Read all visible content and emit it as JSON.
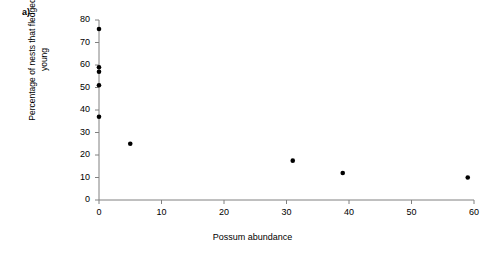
{
  "panel": {
    "label": "a)"
  },
  "chart_data": {
    "type": "scatter",
    "title": "",
    "subtitle": "",
    "xlabel": "Possum abundance",
    "ylabel": "Percentage of nests that fledged young",
    "xlim": [
      0,
      60
    ],
    "ylim": [
      0,
      80
    ],
    "xticks": [
      0,
      10,
      20,
      30,
      40,
      50,
      60
    ],
    "yticks": [
      0,
      10,
      20,
      30,
      40,
      50,
      60,
      70,
      80
    ],
    "xtick_labels": [
      "0",
      "10",
      "20",
      "30",
      "40",
      "50",
      "60"
    ],
    "ytick_labels": [
      "0",
      "10",
      "20",
      "30",
      "40",
      "50",
      "60",
      "70",
      "80"
    ],
    "grid": false,
    "legend": null,
    "marker": "filled-circle",
    "marker_color": "#000000",
    "marker_size_px": 4.6,
    "axis_color": "#808080",
    "series": [
      {
        "name": "nest success vs possum abundance",
        "x": [
          0,
          0,
          0,
          0,
          0,
          5,
          31,
          39,
          59
        ],
        "y": [
          76,
          59,
          57,
          51,
          37,
          25,
          17.5,
          12,
          10
        ]
      }
    ],
    "annotations": []
  }
}
